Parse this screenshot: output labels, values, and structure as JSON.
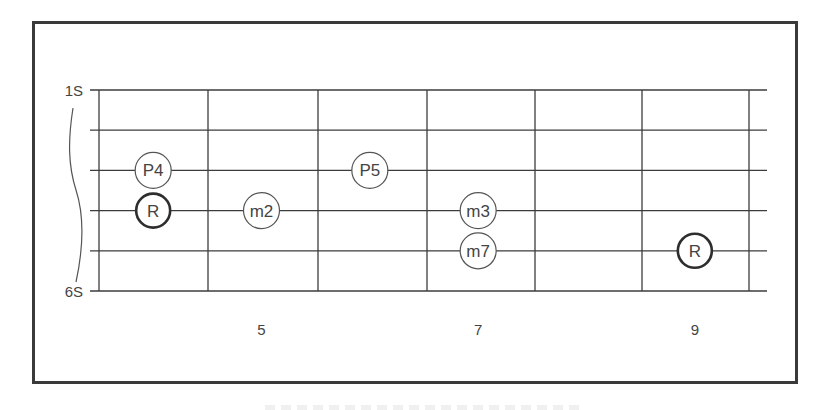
{
  "diagram": {
    "type": "guitar-fretboard-interval-map",
    "string_labels": {
      "top": "1S",
      "bottom": "6S"
    },
    "string_count": 6,
    "fret_count_visible": 6,
    "first_fret_number": 4,
    "fret_numbers": [
      {
        "fret": 5,
        "label": "5"
      },
      {
        "fret": 7,
        "label": "7"
      },
      {
        "fret": 9,
        "label": "9"
      }
    ],
    "notes": [
      {
        "string": 3,
        "fret": 4,
        "label": "P4",
        "root": false
      },
      {
        "string": 4,
        "fret": 4,
        "label": "R",
        "root": true
      },
      {
        "string": 4,
        "fret": 5,
        "label": "m2",
        "root": false
      },
      {
        "string": 3,
        "fret": 6,
        "label": "P5",
        "root": false
      },
      {
        "string": 4,
        "fret": 7,
        "label": "m3",
        "root": false
      },
      {
        "string": 5,
        "fret": 7,
        "label": "m7",
        "root": false
      },
      {
        "string": 5,
        "fret": 9,
        "label": "R",
        "root": true
      }
    ],
    "colors": {
      "line": "#3c3c3c",
      "frame": "#3a3a3a",
      "text": "#444444",
      "background": "#ffffff"
    }
  }
}
